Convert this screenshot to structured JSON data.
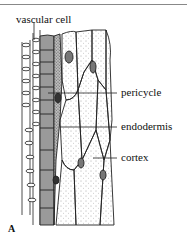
{
  "figure": {
    "panel_label": "A",
    "labels": {
      "vascular_cell": "vascular cell",
      "pericycle": "pericycle",
      "endodermis": "endodermis",
      "cortex": "cortex"
    },
    "colors": {
      "pericycle_fill": "#9a9a9a",
      "endodermis_fill": "#6e6e6e",
      "line": "#222222",
      "background": "#ffffff"
    }
  }
}
